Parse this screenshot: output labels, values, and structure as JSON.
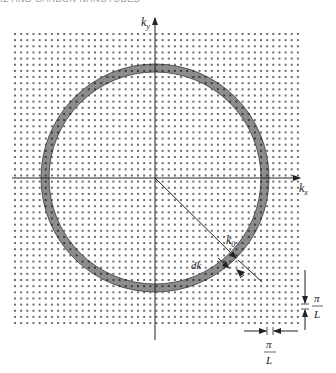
{
  "header": {
    "running_title": "IZ AND CARBON NANOTUBES"
  },
  "figure": {
    "axes": {
      "x_label": "k",
      "x_label_sub": "x",
      "y_label": "k",
      "y_label_sub": "y"
    },
    "radius_label": "k",
    "radius_label_sub": "0",
    "shell_label": "dk",
    "spacing_vertical": {
      "numerator": "π",
      "denominator": "L"
    },
    "spacing_horizontal": {
      "numerator": "π",
      "denominator": "L"
    },
    "colors": {
      "dots": "#6e6e6e",
      "axis": "#222222",
      "ring_fill": "#8c8c8c",
      "ring_edge": "#3a3a3a",
      "background": "#ffffff"
    },
    "geometry": {
      "grid_left": 15,
      "grid_top": 34,
      "grid_right": 297,
      "grid_bottom": 322,
      "dot_spacing": 6.15,
      "center_x": 155,
      "center_y": 178,
      "ring_outer_r": 114,
      "ring_inner_r": 106
    }
  }
}
